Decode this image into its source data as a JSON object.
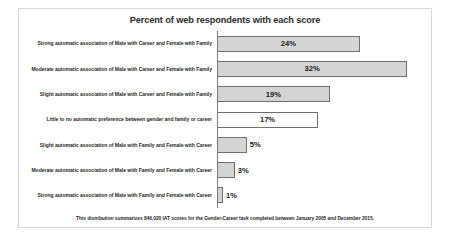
{
  "chart_data": {
    "type": "bar",
    "orientation": "horizontal",
    "title": "Percent of web respondents with each score",
    "xlabel": "",
    "ylabel": "",
    "xlim": [
      0,
      35
    ],
    "grid": false,
    "legend": false,
    "note": "This distribution summarizes 846,020 IAT scores for the Gender-Career task completed between January 2005 and December 2015.",
    "categories": [
      "Strong automatic association of Male with Career and Female with Family",
      "Moderate automatic association of Male with Career and Female with Family",
      "Slight automatic association of Male with Career and Female with Family",
      "Little to no automatic preference between gender and family or career",
      "Slight automatic association of Male with Family and Female with Career",
      "Moderate automatic association of Male with Family and Female with Career",
      "Strong automatic association of Male with Family and Female with Career"
    ],
    "values": [
      24,
      32,
      19,
      17,
      5,
      3,
      1
    ],
    "value_labels": [
      "24%",
      "32%",
      "19%",
      "17%",
      "5%",
      "3%",
      "1%"
    ],
    "bar_fill": [
      "#d4d4d4",
      "#d4d4d4",
      "#d4d4d4",
      "#ffffff",
      "#d4d4d4",
      "#d4d4d4",
      "#d4d4d4"
    ],
    "bar_border": "#6e6e6e",
    "label_inside": [
      true,
      true,
      true,
      true,
      false,
      false,
      false
    ]
  }
}
